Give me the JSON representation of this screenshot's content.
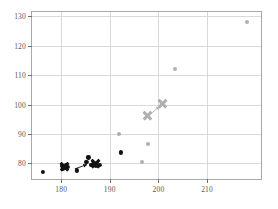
{
  "chart_data": {
    "type": "scatter",
    "title": "",
    "xlabel": "",
    "ylabel": "",
    "xlim": [
      174.0,
      221.5
    ],
    "ylim": [
      74.0,
      131.5
    ],
    "xticks": [
      180,
      190,
      200,
      210
    ],
    "yticks": [
      80,
      90,
      100,
      110,
      120,
      130
    ],
    "xtick_labels": [
      "180",
      "190",
      "200",
      "210"
    ],
    "ytick_labels": [
      "80",
      "90",
      "100",
      "110",
      "120",
      "130"
    ],
    "grid": true,
    "legend": "none",
    "colors": {
      "series_black": "#111111",
      "series_gray": "#b0b0b0",
      "grid": "#d9d9d9",
      "axis": "#a8a8a8",
      "tick_text": "#595959",
      "background": "#ffffff"
    },
    "series": [
      {
        "name": "black-points",
        "color": "#111111",
        "marker": "circle",
        "points": [
          {
            "x": 176.3,
            "y": 77.2
          },
          {
            "x": 180.1,
            "y": 79.0
          },
          {
            "x": 180.3,
            "y": 78.3
          },
          {
            "x": 180.8,
            "y": 78.6
          },
          {
            "x": 181.0,
            "y": 79.6
          },
          {
            "x": 181.4,
            "y": 78.9
          },
          {
            "x": 183.3,
            "y": 77.6
          },
          {
            "x": 185.2,
            "y": 80.4
          },
          {
            "x": 185.6,
            "y": 82.0
          },
          {
            "x": 186.2,
            "y": 79.5
          },
          {
            "x": 186.6,
            "y": 79.9
          },
          {
            "x": 187.1,
            "y": 79.2
          },
          {
            "x": 187.4,
            "y": 80.1
          },
          {
            "x": 187.9,
            "y": 79.6
          },
          {
            "x": 192.2,
            "y": 83.7
          }
        ]
      },
      {
        "name": "black-x-markers",
        "color": "#111111",
        "marker": "x",
        "points": [
          {
            "x": 180.7,
            "y": 78.9
          },
          {
            "x": 187.0,
            "y": 79.8
          }
        ],
        "arrow": {
          "from": {
            "x": 182.8,
            "y": 78.1
          },
          "to": {
            "x": 185.3,
            "y": 79.6
          }
        }
      },
      {
        "name": "gray-points",
        "color": "#b0b0b0",
        "marker": "circle",
        "points": [
          {
            "x": 191.8,
            "y": 90.0
          },
          {
            "x": 196.6,
            "y": 80.3
          },
          {
            "x": 197.9,
            "y": 86.6
          },
          {
            "x": 203.4,
            "y": 112.2
          },
          {
            "x": 218.2,
            "y": 128.1
          }
        ]
      },
      {
        "name": "gray-x-markers",
        "color": "#b0b0b0",
        "marker": "x",
        "points": [
          {
            "x": 197.7,
            "y": 96.3
          },
          {
            "x": 200.9,
            "y": 100.2
          }
        ],
        "arrow": {
          "from": {
            "x": 198.7,
            "y": 97.2
          },
          "to": {
            "x": 200.2,
            "y": 99.4
          }
        }
      }
    ]
  }
}
